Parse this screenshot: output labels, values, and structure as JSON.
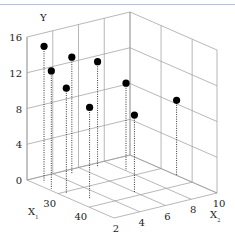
{
  "chart_data": {
    "type": "scatter",
    "subtype": "3d-scatter-with-drop-lines",
    "title": "",
    "axes": {
      "x1": {
        "label": "X",
        "subscript": "1",
        "ticks": [
          30,
          40
        ],
        "range": [
          20,
          48
        ]
      },
      "x2": {
        "label": "X",
        "subscript": "2",
        "ticks": [
          2,
          4,
          6,
          8,
          10
        ],
        "range": [
          2,
          10
        ]
      },
      "y": {
        "label": "Y",
        "ticks": [
          0,
          4,
          8,
          12,
          16
        ],
        "range": [
          0,
          16
        ]
      }
    },
    "grid": true,
    "legend": null,
    "points": [
      {
        "x1": 23,
        "x2": 2.6,
        "y": 15.2
      },
      {
        "x1": 27,
        "x2": 2.2,
        "y": 13.2
      },
      {
        "x1": 31,
        "x2": 2.4,
        "y": 11.8
      },
      {
        "x1": 22,
        "x2": 5.0,
        "y": 13.0
      },
      {
        "x1": 36,
        "x2": 3.0,
        "y": 10.2
      },
      {
        "x1": 22,
        "x2": 7.0,
        "y": 11.8
      },
      {
        "x1": 38,
        "x2": 6.0,
        "y": 8.6
      },
      {
        "x1": 27,
        "x2": 8.0,
        "y": 9.8
      },
      {
        "x1": 35,
        "x2": 10.0,
        "y": 8.4
      }
    ]
  },
  "labels": {
    "y_axis": "Y",
    "x1_axis": "X",
    "x1_sub": "1",
    "x2_axis": "X",
    "x2_sub": "2"
  }
}
